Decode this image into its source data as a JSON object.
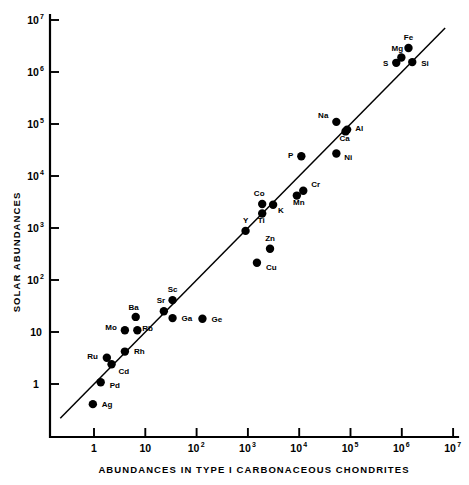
{
  "chart_data": {
    "type": "scatter",
    "title": "",
    "xlabel": "ABUNDANCES IN TYPE I CARBONACEOUS CHONDRITES",
    "ylabel": "SOLAR ABUNDANCES",
    "xscale": "log",
    "yscale": "log",
    "xlim": [
      0.1,
      10000000
    ],
    "ylim": [
      0.1,
      10000000
    ],
    "grid": false,
    "legend": "none",
    "xticklabels": [
      "1",
      "10",
      "10²",
      "10³",
      "10⁴",
      "10⁵",
      "10⁶",
      "10⁷"
    ],
    "xtickvalues": [
      1,
      10,
      100,
      1000,
      10000,
      100000,
      1000000,
      10000000
    ],
    "yticklabels": [
      "1",
      "10",
      "10²",
      "10³",
      "10⁴",
      "10⁵",
      "10⁶",
      "10⁷"
    ],
    "ytickvalues": [
      1,
      10,
      100,
      1000,
      10000,
      100000,
      1000000,
      10000000
    ],
    "reference_line": {
      "label": "",
      "slope": 1,
      "intercept": 0,
      "description": "one-to-one correlation line"
    },
    "points": [
      {
        "label": "Ag",
        "x": 0.95,
        "y": 0.41
      },
      {
        "label": "Pd",
        "x": 1.35,
        "y": 1.08
      },
      {
        "label": "Ru",
        "x": 1.78,
        "y": 3.2
      },
      {
        "label": "Cd",
        "x": 2.2,
        "y": 2.4
      },
      {
        "label": "Rh",
        "x": 4.0,
        "y": 4.2
      },
      {
        "label": "Mo",
        "x": 4.0,
        "y": 10.8
      },
      {
        "label": "Rb",
        "x": 7.0,
        "y": 10.8
      },
      {
        "label": "Ba",
        "x": 6.5,
        "y": 19.5
      },
      {
        "label": "Sr",
        "x": 23.0,
        "y": 25.0
      },
      {
        "label": "Sc",
        "x": 34.0,
        "y": 41.0
      },
      {
        "label": "Ga",
        "x": 34.0,
        "y": 18.5
      },
      {
        "label": "Ge",
        "x": 130.0,
        "y": 18.0
      },
      {
        "label": "Y",
        "x": 900,
        "y": 880
      },
      {
        "label": "Cu",
        "x": 1500,
        "y": 215
      },
      {
        "label": "Zn",
        "x": 2700,
        "y": 400
      },
      {
        "label": "Ti",
        "x": 1900,
        "y": 1900
      },
      {
        "label": "Co",
        "x": 1900,
        "y": 2900
      },
      {
        "label": "K",
        "x": 3100,
        "y": 2800
      },
      {
        "label": "Mn",
        "x": 9000,
        "y": 4200
      },
      {
        "label": "Cr",
        "x": 12000,
        "y": 5200
      },
      {
        "label": "P",
        "x": 11000,
        "y": 24000
      },
      {
        "label": "Ni",
        "x": 53000,
        "y": 27000
      },
      {
        "label": "Na",
        "x": 53000,
        "y": 110000
      },
      {
        "label": "Al",
        "x": 86000,
        "y": 78000
      },
      {
        "label": "Ca",
        "x": 80000,
        "y": 72000
      },
      {
        "label": "S",
        "x": 780000,
        "y": 1500000
      },
      {
        "label": "Mg",
        "x": 980000,
        "y": 1900000
      },
      {
        "label": "Si",
        "x": 1600000,
        "y": 1550000
      },
      {
        "label": "Fe",
        "x": 1350000,
        "y": 2900000
      }
    ]
  },
  "colors": {
    "background": "#ffffff",
    "ink": "#000000"
  }
}
